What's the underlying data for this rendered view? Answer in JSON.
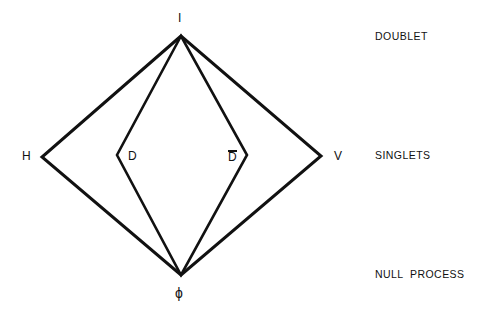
{
  "figure": {
    "background_color": "#ffffff",
    "stroke_color": "#111111",
    "text_color": "#111111",
    "width": 481,
    "height": 314
  },
  "vertices": {
    "top": {
      "label": "I",
      "x": 181,
      "y": 36,
      "label_x": 178,
      "label_y": 12
    },
    "bottom": {
      "label": "ϕ",
      "x": 181,
      "y": 275,
      "label_x": 175,
      "label_y": 286
    },
    "outer_left": {
      "label": "H",
      "x": 42,
      "y": 157,
      "label_x": 22,
      "label_y": 150
    },
    "outer_right": {
      "label": "V",
      "x": 321,
      "y": 156,
      "label_x": 334,
      "label_y": 150
    },
    "inner_left": {
      "label": "D",
      "x": 117,
      "y": 155,
      "label_x": 128,
      "label_y": 150
    },
    "inner_right": {
      "label": "D",
      "overbar": true,
      "x": 247,
      "y": 155,
      "label_x": 228,
      "label_y": 150
    }
  },
  "side_labels": [
    {
      "text": "DOUBLET",
      "x": 375,
      "y": 31
    },
    {
      "text": "SINGLETS",
      "x": 375,
      "y": 150
    },
    {
      "text": "NULL  PROCESS",
      "x": 375,
      "y": 269
    }
  ],
  "shapes": {
    "outer_diamond": {
      "name": "outer-diamond",
      "points": "181,36 42,157 181,275 321,156",
      "stroke_width": 3
    },
    "inner_diamond": {
      "name": "inner-diamond",
      "points": "181,36 117,155 181,275 247,155",
      "stroke_width": 2.6
    }
  }
}
